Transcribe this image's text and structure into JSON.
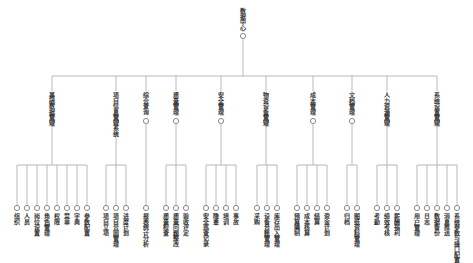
{
  "diagram": {
    "type": "tree",
    "colors": {
      "line": "#b8b8b8",
      "node": "#8a8a8a",
      "text": "#333333"
    },
    "root": {
      "label": "数据中心",
      "x": 243
    },
    "branches": [
      {
        "label": "基础数据管理",
        "x": 52,
        "children": [
          {
            "label": "组织",
            "x": 17
          },
          {
            "label": "人员",
            "x": 27
          },
          {
            "label": "岗位设置",
            "x": 37
          },
          {
            "label": "角色管理",
            "x": 47
          },
          {
            "label": "权限",
            "x": 57
          },
          {
            "label": "菜单",
            "x": 67
          },
          {
            "label": "字典",
            "x": 77
          },
          {
            "label": "参数配置",
            "x": 87
          }
        ]
      },
      {
        "label": "项目信息管理系统",
        "x": 116,
        "children": [
          {
            "label": "项目立项",
            "x": 106
          },
          {
            "label": "项目合同管理",
            "x": 116
          },
          {
            "label": "进度计划",
            "x": 126
          }
        ]
      },
      {
        "label": "综合查询",
        "x": 146,
        "children": [
          {
            "label": "报表统计分析",
            "x": 146
          }
        ]
      },
      {
        "label": "质量管理",
        "x": 176,
        "children": [
          {
            "label": "质量检查",
            "x": 166
          },
          {
            "label": "质量问题整改",
            "x": 176
          },
          {
            "label": "验收评定",
            "x": 186
          }
        ]
      },
      {
        "label": "安全管理",
        "x": 221,
        "children": [
          {
            "label": "安全巡查记录",
            "x": 206
          },
          {
            "label": "隐患",
            "x": 216
          },
          {
            "label": "培训",
            "x": 226
          },
          {
            "label": "事故",
            "x": 236
          }
        ]
      },
      {
        "label": "物资设备管理",
        "x": 266,
        "children": [
          {
            "label": "采购",
            "x": 257
          },
          {
            "label": "设备台账管理",
            "x": 267
          },
          {
            "label": "库存出入管理",
            "x": 277
          }
        ]
      },
      {
        "label": "成本管理",
        "x": 313,
        "children": [
          {
            "label": "预算编制",
            "x": 297
          },
          {
            "label": "成本核算",
            "x": 307
          },
          {
            "label": "结算",
            "x": 317
          },
          {
            "label": "资金计划",
            "x": 327
          }
        ]
      },
      {
        "label": "文档管理",
        "x": 352,
        "children": [
          {
            "label": "归档",
            "x": 347
          },
          {
            "label": "图纸资料管理",
            "x": 357
          }
        ]
      },
      {
        "label": "人力资源管理",
        "x": 387,
        "children": [
          {
            "label": "考勤",
            "x": 377
          },
          {
            "label": "绩效考核",
            "x": 387
          },
          {
            "label": "薪酬福利",
            "x": 397
          }
        ]
      },
      {
        "label": "系统设置管理",
        "x": 437,
        "children": [
          {
            "label": "用户管理",
            "x": 417
          },
          {
            "label": "日志",
            "x": 427
          },
          {
            "label": "数据备份",
            "x": 437
          },
          {
            "label": "消息推送",
            "x": 447
          },
          {
            "label": "系统参数与接口配置",
            "x": 457
          }
        ]
      }
    ]
  }
}
